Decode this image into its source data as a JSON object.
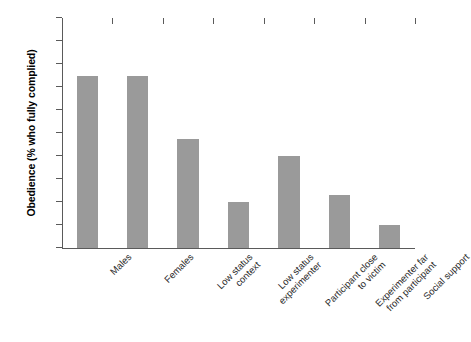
{
  "chart_data": {
    "type": "bar",
    "title": "",
    "xlabel": "",
    "ylabel": "Obedience (% who fully complied)",
    "ylim": [
      0,
      100
    ],
    "ytick_values": [
      0,
      10,
      20,
      30,
      40,
      50,
      60,
      70,
      80,
      90,
      100
    ],
    "ytick_labels": [
      "0",
      "10",
      "20",
      "30",
      "40",
      "50",
      "60",
      "70",
      "80",
      "90",
      "100"
    ],
    "grid": false,
    "legend": false,
    "bar_color": "#9a9a9a",
    "categories": [
      "Males",
      "Females",
      "Low status context",
      "Low status experimenter",
      "Participant close to victim",
      "Experimenter far from participant",
      "Social support"
    ],
    "category_label_lines": [
      [
        "Males"
      ],
      [
        "Females"
      ],
      [
        "Low status",
        "context"
      ],
      [
        "Low status",
        "experimenter"
      ],
      [
        "Participant close",
        "to victim"
      ],
      [
        "Experimenter far",
        "from participant"
      ],
      [
        "Social support"
      ]
    ],
    "values": [
      75,
      75,
      47.5,
      20,
      40,
      23,
      10
    ]
  }
}
